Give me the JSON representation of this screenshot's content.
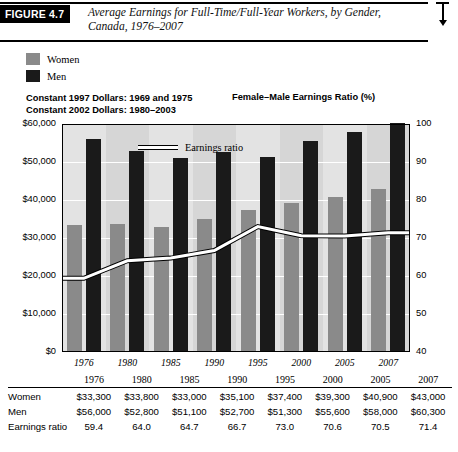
{
  "figure": {
    "tag": "FIGURE 4.7",
    "title": "Average Earnings for Full-Time/Full-Year Workers, by Gender, Canada, 1976–2007"
  },
  "legend": {
    "items": [
      {
        "label": "Women",
        "color": "#8a8a8a"
      },
      {
        "label": "Men",
        "color": "#1a1a1a"
      }
    ],
    "inline_line_label": "Earnings ratio"
  },
  "subtitles": {
    "left_line1": "Constant 1997 Dollars: 1969 and 1975",
    "left_line2": "Constant 2002 Dollars: 1980–2003",
    "right": "Female–Male Earnings Ratio (%)"
  },
  "chart_data": {
    "type": "bar",
    "title": "Average Earnings for Full-Time/Full-Year Workers, by Gender, Canada, 1976–2007",
    "xlabel": "",
    "ylabel": "",
    "categories": [
      "1976",
      "1980",
      "1985",
      "1990",
      "1995",
      "2000",
      "2005",
      "2007"
    ],
    "series": [
      {
        "name": "Women",
        "values": [
          33300,
          33800,
          33000,
          35100,
          37400,
          39300,
          40900,
          43000
        ]
      },
      {
        "name": "Men",
        "values": [
          56000,
          52800,
          51100,
          52700,
          51300,
          55600,
          58000,
          60300
        ]
      }
    ],
    "line_series": {
      "name": "Earnings ratio",
      "values": [
        59.4,
        64.0,
        64.7,
        66.7,
        73.0,
        70.6,
        70.5,
        71.4
      ],
      "axis": "right"
    },
    "ylim": [
      0,
      60000
    ],
    "yticks": [
      "$0",
      "$10,000",
      "$20,000",
      "$30,000",
      "$40,000",
      "$50,000",
      "$60,000"
    ],
    "ylim_right": [
      40,
      100
    ],
    "yticks_right": [
      "40",
      "50",
      "60",
      "70",
      "80",
      "90",
      "100"
    ],
    "grid": true,
    "legend_position": "top-left"
  },
  "table": {
    "header": [
      "",
      "1976",
      "1980",
      "1985",
      "1990",
      "1995",
      "2000",
      "2005",
      "2007"
    ],
    "rows": [
      {
        "label": "Women",
        "values": [
          "$33,300",
          "$33,800",
          "$33,000",
          "$35,100",
          "$37,400",
          "$39,300",
          "$40,900",
          "$43,000"
        ]
      },
      {
        "label": "Men",
        "values": [
          "$56,000",
          "$52,800",
          "$51,100",
          "$52,700",
          "$51,300",
          "$55,600",
          "$58,000",
          "$60,300"
        ]
      },
      {
        "label": "Earnings ratio",
        "values": [
          "59.4",
          "64.0",
          "64.7",
          "66.7",
          "73.0",
          "70.6",
          "70.5",
          "71.4"
        ]
      }
    ]
  }
}
